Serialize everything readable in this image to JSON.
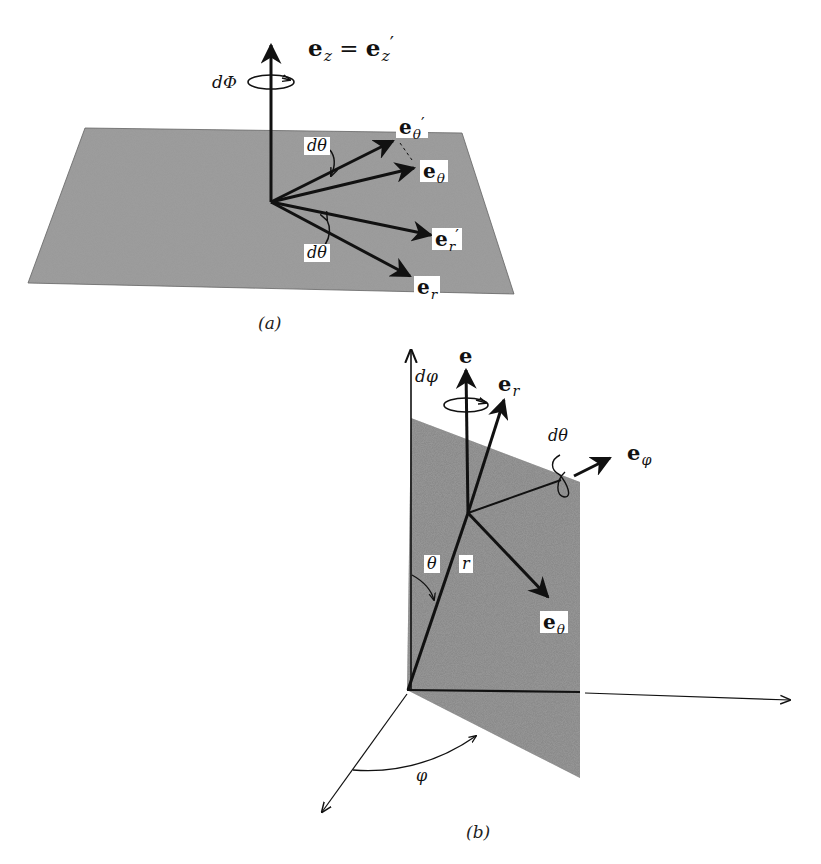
{
  "figure_a": {
    "caption": "(a)",
    "labels": {
      "ez_base": "e",
      "ez_sub": "z",
      "equals": " = ",
      "ezp_base": "e",
      "ezp_sub": "z",
      "ezp_prime": "′",
      "dPhi": "dΦ",
      "etheta_prime_base": "e",
      "etheta_prime_sub": "θ",
      "etheta_prime_mark": "′",
      "etheta_base": "e",
      "etheta_sub": "θ",
      "er_prime_base": "e",
      "er_prime_sub": "r",
      "er_prime_mark": "′",
      "er_base": "e",
      "er_sub": "r",
      "dtheta_top": "dθ",
      "dtheta_bottom": "dθ"
    }
  },
  "figure_b": {
    "caption": "(b)",
    "labels": {
      "e_top": "e",
      "dphi": "dφ",
      "er_base": "e",
      "er_sub": "r",
      "dtheta": "dθ",
      "ephi_base": "e",
      "ephi_sub": "φ",
      "theta": "θ",
      "r": "r",
      "etheta_base": "e",
      "etheta_sub": "θ",
      "phi": "φ"
    }
  },
  "colors": {
    "plane_fill": "#8a8a8a",
    "ink": "#111111",
    "background": "#ffffff"
  }
}
